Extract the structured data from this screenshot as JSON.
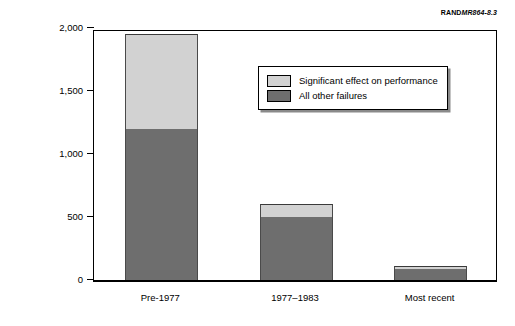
{
  "source_credit": {
    "prefix": "RAND",
    "code": "MR864-8.3"
  },
  "chart_data": {
    "type": "bar",
    "subtype": "stacked-vertical",
    "title": "",
    "xlabel": "",
    "ylabel": "Number of incidents",
    "ylim": [
      0,
      2000
    ],
    "yticks": [
      0,
      500,
      1000,
      1500,
      2000
    ],
    "ytick_labels": [
      "0",
      "500",
      "1,000",
      "1,500",
      "2,000"
    ],
    "grid": false,
    "legend_position": "upper-right-inside",
    "categories": [
      "Pre-1977",
      "1977–1983",
      "Most recent"
    ],
    "series": [
      {
        "name": "All other failures",
        "color": "#6e6e6e",
        "values": [
          1200,
          500,
          90
        ]
      },
      {
        "name": "Significant effect on performance",
        "color": "#d2d2d2",
        "values": [
          750,
          100,
          20
        ]
      }
    ],
    "totals": [
      1950,
      600,
      110
    ]
  },
  "legend": {
    "items": [
      {
        "label": "Significant effect on performance",
        "color": "#d2d2d2"
      },
      {
        "label": "All other failures",
        "color": "#6e6e6e"
      }
    ]
  }
}
